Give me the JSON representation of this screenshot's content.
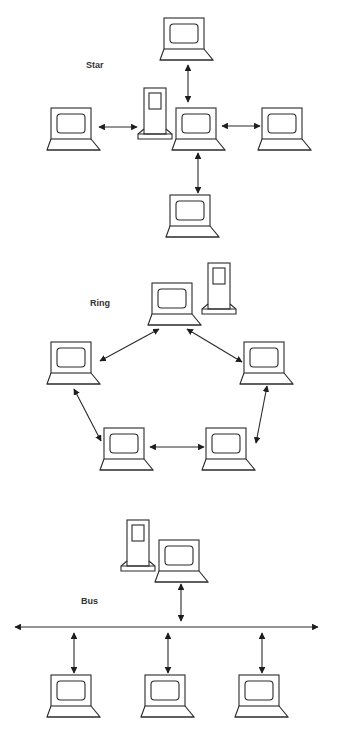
{
  "diagram": {
    "colors": {
      "stroke": "#2a2a2a",
      "background": "#ffffff",
      "label": "#333333"
    },
    "sections": [
      {
        "id": "star",
        "label": "Star",
        "nodes": [
          {
            "id": "star-top",
            "type": "computer",
            "x": 160,
            "y": 18
          },
          {
            "id": "star-left",
            "type": "computer",
            "x": 47,
            "y": 108
          },
          {
            "id": "star-center",
            "type": "computer",
            "x": 172,
            "y": 108
          },
          {
            "id": "star-right",
            "type": "computer",
            "x": 258,
            "y": 108
          },
          {
            "id": "star-bottom",
            "type": "computer",
            "x": 166,
            "y": 195
          },
          {
            "id": "star-server",
            "type": "server",
            "x": 137,
            "y": 88
          }
        ],
        "links": [
          {
            "from": "star-top",
            "to": "star-center",
            "bidirectional": true
          },
          {
            "from": "star-left",
            "to": "star-server",
            "bidirectional": true
          },
          {
            "from": "star-center",
            "to": "star-right",
            "bidirectional": true
          },
          {
            "from": "star-center",
            "to": "star-bottom",
            "bidirectional": true
          }
        ]
      },
      {
        "id": "ring",
        "label": "Ring",
        "nodes": [
          {
            "id": "ring-top",
            "type": "computer",
            "x": 148,
            "y": 283
          },
          {
            "id": "ring-server",
            "type": "server",
            "x": 201,
            "y": 263
          },
          {
            "id": "ring-left",
            "type": "computer",
            "x": 47,
            "y": 342
          },
          {
            "id": "ring-right",
            "type": "computer",
            "x": 240,
            "y": 342
          },
          {
            "id": "ring-bottom-left",
            "type": "computer",
            "x": 100,
            "y": 428
          },
          {
            "id": "ring-bottom-right",
            "type": "computer",
            "x": 202,
            "y": 428
          }
        ],
        "links": [
          {
            "from": "ring-top",
            "to": "ring-left",
            "bidirectional": true
          },
          {
            "from": "ring-top",
            "to": "ring-right",
            "bidirectional": true
          },
          {
            "from": "ring-left",
            "to": "ring-bottom-left",
            "bidirectional": true
          },
          {
            "from": "ring-bottom-left",
            "to": "ring-bottom-right",
            "bidirectional": true
          },
          {
            "from": "ring-bottom-right",
            "to": "ring-right",
            "bidirectional": true
          }
        ]
      },
      {
        "id": "bus",
        "label": "Bus",
        "nodes": [
          {
            "id": "bus-server",
            "type": "server",
            "x": 120,
            "y": 520
          },
          {
            "id": "bus-top",
            "type": "computer",
            "x": 155,
            "y": 540
          },
          {
            "id": "bus-bottom-1",
            "type": "computer",
            "x": 47,
            "y": 675
          },
          {
            "id": "bus-bottom-2",
            "type": "computer",
            "x": 141,
            "y": 675
          },
          {
            "id": "bus-bottom-3",
            "type": "computer",
            "x": 235,
            "y": 675
          }
        ],
        "backbone": {
          "y": 627,
          "x1": 15,
          "x2": 318,
          "bidirectional": true
        },
        "links": [
          {
            "from": "bus-top",
            "to": "backbone",
            "bidirectional": true
          },
          {
            "from": "backbone",
            "to": "bus-bottom-1",
            "bidirectional": true
          },
          {
            "from": "backbone",
            "to": "bus-bottom-2",
            "bidirectional": true
          },
          {
            "from": "backbone",
            "to": "bus-bottom-3",
            "bidirectional": true
          }
        ]
      }
    ]
  }
}
